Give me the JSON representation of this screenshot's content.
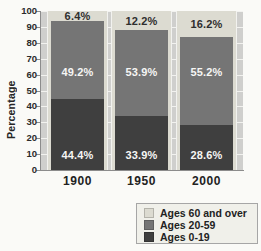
{
  "chart_data": {
    "type": "bar",
    "stacked": true,
    "title": "",
    "categories": [
      "1900",
      "1950",
      "2000"
    ],
    "series": [
      {
        "name": "Ages 0-19",
        "color": "#3f3f3f",
        "values": [
          44.4,
          33.9,
          28.6
        ],
        "labels": [
          "44.4%",
          "33.9%",
          "28.6%"
        ],
        "label_color": "#f6f6f4"
      },
      {
        "name": "Ages 20-59",
        "color": "#757575",
        "values": [
          49.2,
          53.9,
          55.2
        ],
        "labels": [
          "49.2%",
          "53.9%",
          "55.2%"
        ],
        "label_color": "#f6f6f4"
      },
      {
        "name": "Ages 60 and over",
        "color": "#dcdbd1",
        "values": [
          6.4,
          12.2,
          16.2
        ],
        "labels": [
          "6.4%",
          "12.2%",
          "16.2%"
        ],
        "label_color": "#2e2e2e"
      }
    ],
    "xlabel": "",
    "ylabel": "Percentage",
    "ylim": [
      0,
      100
    ],
    "ytick_step": 10,
    "yticks": [
      "0",
      "10",
      "20",
      "30",
      "40",
      "50",
      "60",
      "70",
      "80",
      "90",
      "100"
    ],
    "grid": true,
    "legend": {
      "position": "bottom-right",
      "items": [
        {
          "label": "Ages 60 and over",
          "color": "#dcdbd1"
        },
        {
          "label": "Ages 20-59",
          "color": "#757575"
        },
        {
          "label": "Ages 0-19",
          "color": "#3f3f3f"
        }
      ]
    }
  },
  "colors": {
    "page_bg": "#fafaf7",
    "plot_bg": "#cfcfcd",
    "column_band": "#dcdbd1",
    "gridline": "#f2f2ef",
    "axis": "#8c8c8c",
    "text": "#222222",
    "legend_bg": "#f0f0ea",
    "legend_border": "#a6a6a6"
  }
}
